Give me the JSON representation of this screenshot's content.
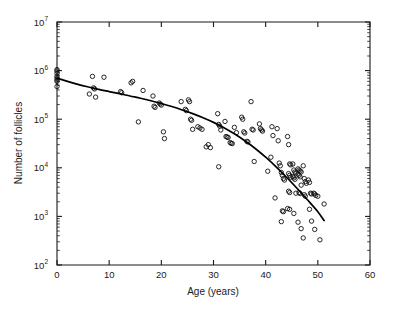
{
  "figure": {
    "background_color": "#ffffff",
    "ink_color": "#1a1a1a"
  },
  "chart_data": {
    "type": "scatter",
    "title": "",
    "subtitle": "",
    "xlabel": "Age (years)",
    "ylabel": "Number of follicles",
    "xlim": [
      0,
      60
    ],
    "ylim": [
      100,
      10000000
    ],
    "yscale": "log",
    "xscale": "linear",
    "grid": false,
    "legend": null,
    "x_ticks": [
      0,
      10,
      20,
      30,
      40,
      50,
      60
    ],
    "x_tick_labels": [
      "0",
      "10",
      "20",
      "30",
      "40",
      "50",
      "60"
    ],
    "y_ticks": [
      100,
      1000,
      10000,
      100000,
      1000000,
      10000000
    ],
    "y_tick_labels": [
      "10^2",
      "10^3",
      "10^4",
      "10^5",
      "10^6",
      "10^7"
    ],
    "y_tick_mantissa": [
      "10",
      "10",
      "10",
      "10",
      "10",
      "10"
    ],
    "y_tick_exponents": [
      "2",
      "3",
      "4",
      "5",
      "6",
      "7"
    ],
    "y_minor_ticks": true,
    "marker": "open-circle",
    "marker_size_px": 3.4,
    "marker_color": "#111111",
    "series": [
      {
        "name": "Follicle counts",
        "marker": "open-circle",
        "points": [
          [
            0,
            1050000
          ],
          [
            0,
            980000
          ],
          [
            0,
            880000
          ],
          [
            0,
            760000
          ],
          [
            0,
            700000
          ],
          [
            0,
            640000
          ],
          [
            0,
            600000
          ],
          [
            0,
            470000
          ],
          [
            6.2,
            330000
          ],
          [
            6.8,
            760000
          ],
          [
            7.0,
            440000
          ],
          [
            7.2,
            420000
          ],
          [
            7.4,
            285000
          ],
          [
            9.0,
            730000
          ],
          [
            12.2,
            370000
          ],
          [
            12.4,
            350000
          ],
          [
            14.2,
            560000
          ],
          [
            14.5,
            600000
          ],
          [
            15.6,
            88000
          ],
          [
            16.5,
            390000
          ],
          [
            18.4,
            300000
          ],
          [
            18.6,
            185000
          ],
          [
            18.8,
            175000
          ],
          [
            19.6,
            215000
          ],
          [
            19.8,
            205000
          ],
          [
            20.0,
            195000
          ],
          [
            20.4,
            55000
          ],
          [
            20.6,
            40000
          ],
          [
            23.8,
            230000
          ],
          [
            24.6,
            160000
          ],
          [
            24.8,
            150000
          ],
          [
            25.2,
            250000
          ],
          [
            25.4,
            230000
          ],
          [
            25.6,
            100000
          ],
          [
            25.8,
            95000
          ],
          [
            26.0,
            62000
          ],
          [
            27.0,
            70000
          ],
          [
            27.4,
            66000
          ],
          [
            27.8,
            62000
          ],
          [
            28.6,
            27000
          ],
          [
            29.0,
            30000
          ],
          [
            29.4,
            26000
          ],
          [
            30.8,
            130000
          ],
          [
            31.0,
            78000
          ],
          [
            31.2,
            72000
          ],
          [
            31.4,
            60000
          ],
          [
            31.0,
            10500
          ],
          [
            32.2,
            90000
          ],
          [
            32.4,
            44000
          ],
          [
            32.6,
            43000
          ],
          [
            32.8,
            42000
          ],
          [
            33.2,
            33000
          ],
          [
            33.4,
            32000
          ],
          [
            33.6,
            31500
          ],
          [
            34.0,
            68000
          ],
          [
            34.4,
            53000
          ],
          [
            35.4,
            110000
          ],
          [
            35.6,
            100000
          ],
          [
            35.8,
            55000
          ],
          [
            36.0,
            52000
          ],
          [
            36.4,
            35000
          ],
          [
            36.6,
            34000
          ],
          [
            37.2,
            230000
          ],
          [
            37.4,
            62000
          ],
          [
            37.6,
            60000
          ],
          [
            37.8,
            13500
          ],
          [
            38.8,
            80000
          ],
          [
            39.0,
            64000
          ],
          [
            39.2,
            60000
          ],
          [
            39.4,
            57000
          ],
          [
            40.4,
            8500
          ],
          [
            41.0,
            16500
          ],
          [
            41.2,
            70000
          ],
          [
            41.4,
            46000
          ],
          [
            41.8,
            2400
          ],
          [
            42.2,
            64000
          ],
          [
            42.4,
            36000
          ],
          [
            42.6,
            12500
          ],
          [
            42.8,
            11000
          ],
          [
            43.0,
            8000
          ],
          [
            43.2,
            7000
          ],
          [
            43.4,
            6000
          ],
          [
            43.6,
            5600
          ],
          [
            43.2,
            1300
          ],
          [
            43.4,
            1250
          ],
          [
            43.0,
            780
          ],
          [
            44.2,
            44000
          ],
          [
            44.4,
            30000
          ],
          [
            44.6,
            12000
          ],
          [
            44.8,
            11500
          ],
          [
            44.4,
            7600
          ],
          [
            44.6,
            7000
          ],
          [
            44.8,
            6400
          ],
          [
            44.4,
            3300
          ],
          [
            44.6,
            3100
          ],
          [
            44.2,
            1450
          ],
          [
            44.6,
            1400
          ],
          [
            45.2,
            12000
          ],
          [
            45.4,
            9000
          ],
          [
            45.6,
            8200
          ],
          [
            45.8,
            7800
          ],
          [
            45.2,
            6600
          ],
          [
            45.4,
            6200
          ],
          [
            45.6,
            5800
          ],
          [
            45.8,
            3000
          ],
          [
            45.4,
            1150
          ],
          [
            46.2,
            9500
          ],
          [
            46.4,
            9000
          ],
          [
            46.6,
            8600
          ],
          [
            46.8,
            8200
          ],
          [
            46.2,
            7400
          ],
          [
            46.4,
            7000
          ],
          [
            46.6,
            6500
          ],
          [
            46.8,
            4400
          ],
          [
            46.4,
            3100
          ],
          [
            46.6,
            2950
          ],
          [
            46.2,
            760
          ],
          [
            46.8,
            560
          ],
          [
            47.2,
            11000
          ],
          [
            47.4,
            6000
          ],
          [
            47.6,
            5200
          ],
          [
            47.8,
            4800
          ],
          [
            47.4,
            2800
          ],
          [
            47.6,
            2600
          ],
          [
            47.2,
            360
          ],
          [
            48.2,
            5600
          ],
          [
            48.4,
            5000
          ],
          [
            48.6,
            3000
          ],
          [
            48.8,
            2900
          ],
          [
            48.4,
            1400
          ],
          [
            48.8,
            800
          ],
          [
            49.2,
            3000
          ],
          [
            49.4,
            2900
          ],
          [
            49.6,
            2700
          ],
          [
            49.4,
            540
          ],
          [
            50.0,
            2600
          ],
          [
            50.4,
            330
          ],
          [
            51.2,
            1800
          ]
        ]
      }
    ],
    "fit_curve": {
      "name": "fitted decline curve",
      "style": "solid",
      "color": "#000000",
      "points": [
        [
          0,
          700000
        ],
        [
          2,
          600000
        ],
        [
          4,
          520000
        ],
        [
          6,
          460000
        ],
        [
          8,
          410000
        ],
        [
          10,
          370000
        ],
        [
          12,
          335000
        ],
        [
          14,
          300000
        ],
        [
          16,
          270000
        ],
        [
          18,
          240000
        ],
        [
          20,
          210000
        ],
        [
          22,
          182000
        ],
        [
          24,
          155000
        ],
        [
          26,
          130000
        ],
        [
          28,
          107000
        ],
        [
          30,
          86000
        ],
        [
          32,
          67000
        ],
        [
          34,
          50000
        ],
        [
          36,
          36000
        ],
        [
          38,
          25000
        ],
        [
          40,
          16500
        ],
        [
          42,
          10500
        ],
        [
          44,
          6400
        ],
        [
          46,
          3800
        ],
        [
          48,
          2200
        ],
        [
          50,
          1250
        ],
        [
          51.2,
          820
        ]
      ]
    },
    "annotations": []
  },
  "layout": {
    "plot_left_px": 57,
    "plot_right_px": 370,
    "plot_top_px": 22,
    "plot_bottom_px": 265
  }
}
